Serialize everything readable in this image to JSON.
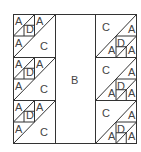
{
  "diagram": {
    "center_label": "B",
    "left_blocks": [
      {
        "small_top_left": "A",
        "small_mid": "D",
        "small_top_right": "A",
        "lower_left": "A",
        "large": "C"
      },
      {
        "small_top_left": "A",
        "small_mid": "D",
        "small_top_right": "A",
        "lower_left": "A",
        "large": "C"
      },
      {
        "small_top_left": "A",
        "small_mid": "D",
        "small_top_right": "A",
        "lower_left": "A",
        "large": "C"
      }
    ],
    "right_blocks": [
      {
        "large": "C",
        "upper_right": "A",
        "small_bottom_left": "A",
        "small_mid": "D",
        "small_bottom_right": "A"
      },
      {
        "large": "C",
        "upper_right": "A",
        "small_bottom_left": "A",
        "small_mid": "D",
        "small_bottom_right": "A"
      },
      {
        "large": "C",
        "upper_right": "A",
        "small_bottom_left": "A",
        "small_mid": "D",
        "small_bottom_right": "A"
      }
    ],
    "colors": {
      "line": "#333333",
      "text": "#444444",
      "background": "#ffffff"
    }
  }
}
